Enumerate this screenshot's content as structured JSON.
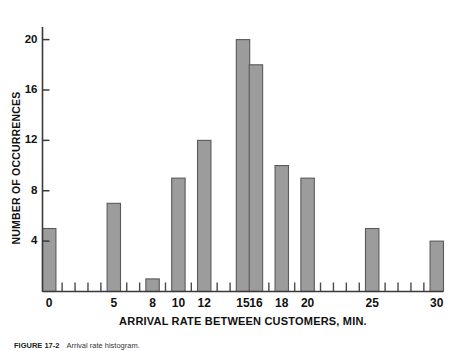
{
  "figure": {
    "caption_id": "FIGURE 17-2",
    "caption_text": "Arrival rate histogram."
  },
  "chart_data": {
    "type": "bar",
    "title": "",
    "subtitle": "",
    "xlabel": "ARRIVAL RATE BETWEEN CUSTOMERS, MIN.",
    "ylabel": "NUMBER OF OCCURRENCES",
    "categories": [
      "0",
      "5",
      "8",
      "10",
      "12",
      "15",
      "16",
      "18",
      "20",
      "25",
      "30"
    ],
    "values": [
      5,
      7,
      1,
      9,
      12,
      20,
      18,
      10,
      9,
      5,
      4
    ],
    "x_values": [
      0,
      5,
      8,
      10,
      12,
      15,
      16,
      18,
      20,
      25,
      30
    ],
    "xlim": [
      0,
      31
    ],
    "ylim": [
      0,
      21
    ],
    "x_tick_labels": [
      "0",
      "5",
      "8",
      "10",
      "12",
      "15",
      "16",
      "18",
      "20",
      "25",
      "30"
    ],
    "y_tick_labels": [
      "4",
      "8",
      "12",
      "16",
      "20"
    ],
    "y_tick_values": [
      4,
      8,
      12,
      16,
      20
    ],
    "x_minor_ticks": [
      1,
      2,
      3,
      4,
      6,
      7,
      9,
      11,
      13,
      14,
      17,
      19,
      21,
      22,
      23,
      24,
      26,
      27,
      28,
      29
    ],
    "grid": false,
    "legend": false,
    "legend_position": "none",
    "bar_color": "#9c9c9c",
    "bar_edge_color": "#5a5a5a",
    "axis_color": "#3a3a3a",
    "background": "#ffffff"
  }
}
